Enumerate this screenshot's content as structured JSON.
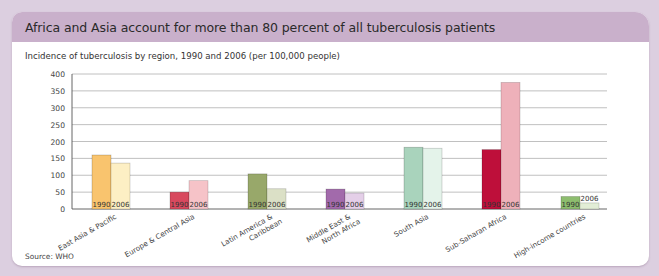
{
  "card": {
    "title": "Africa and Asia account for more than 80 percent of all tuberculosis patients",
    "subtitle": "Incidence of tuberculosis by region, 1990 and 2006 (per 100,000 people)",
    "source": "Source: WHO"
  },
  "colors": {
    "background": "#dccfe0",
    "header": "#c9b0cb",
    "gridline": "#b9b9b9"
  },
  "chart_data": {
    "type": "bar",
    "title": "Africa and Asia account for more than 80 percent of all tuberculosis patients",
    "subtitle": "Incidence of tuberculosis by region, 1990 and 2006 (per 100,000 people)",
    "xlabel": "",
    "ylabel": "Incidence per 100,000 people",
    "ylim": [
      0,
      400
    ],
    "yticks": [
      0,
      50,
      100,
      150,
      200,
      250,
      300,
      350,
      400
    ],
    "grid": true,
    "legend": "none (years labeled inside bars)",
    "categories": [
      "East Asia & Pacific",
      "Europe & Central Asia",
      "Latin America & Caribbean",
      "Middle East & North Africa",
      "South Asia",
      "Sub-Saharan Africa",
      "High-income countries"
    ],
    "category_label_lines": [
      [
        "East Asia & Pacific"
      ],
      [
        "Europe & Central Asia"
      ],
      [
        "Latin America &",
        "Caribbean"
      ],
      [
        "Middle East &",
        "North Africa"
      ],
      [
        "South Asia"
      ],
      [
        "Sub-Saharan Africa"
      ],
      [
        "High-income countries"
      ]
    ],
    "series": [
      {
        "name": "1990",
        "values": [
          160,
          50,
          104,
          59,
          183,
          176,
          37
        ]
      },
      {
        "name": "2006",
        "values": [
          136,
          84,
          60,
          47,
          180,
          375,
          18
        ]
      }
    ],
    "bar_colors": {
      "1990": [
        "#f9c46e",
        "#d8495e",
        "#98a86a",
        "#a26aab",
        "#a9d3bc",
        "#be0f3a",
        "#8dbd6e"
      ],
      "2006": [
        "#fdefc4",
        "#f6c3c8",
        "#dbe0c6",
        "#e4cfe8",
        "#e4f3ea",
        "#eeb1ba",
        "#e2edd6"
      ]
    },
    "source": "Source: WHO"
  }
}
